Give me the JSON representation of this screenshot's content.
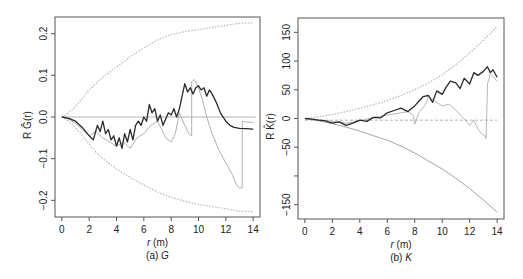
{
  "chart_data": [
    {
      "id": "a",
      "type": "line",
      "caption": "(a) G",
      "caption_prefix": "(a) ",
      "caption_symbol": "G",
      "xlabel": "r (m)",
      "xlabel_var": "r",
      "xlabel_unit": " (m)",
      "ylabel": "R Ĝ(r)",
      "xlim": [
        -0.5,
        14.5
      ],
      "ylim": [
        -0.24,
        0.24
      ],
      "xticks": [
        0,
        2,
        4,
        6,
        8,
        10,
        12,
        14
      ],
      "yticks": [
        -0.2,
        -0.1,
        0.0,
        0.1,
        0.2
      ],
      "ytick_labels": [
        "−0.2",
        "−0.1",
        "0.0",
        "0.1",
        "0.2"
      ],
      "grid": false,
      "frame": {
        "left": 55,
        "top": 17,
        "right": 260,
        "bottom": 217
      },
      "series": [
        {
          "name": "upper envelope",
          "style": "dotted",
          "color": "#b8b8b8",
          "x": [
            0,
            0.5,
            1,
            1.5,
            2,
            2.5,
            3,
            4,
            5,
            6,
            7,
            8,
            9,
            10,
            11,
            12,
            13,
            14
          ],
          "y": [
            0,
            0.01,
            0.025,
            0.045,
            0.065,
            0.08,
            0.095,
            0.12,
            0.145,
            0.165,
            0.185,
            0.198,
            0.205,
            0.21,
            0.215,
            0.22,
            0.225,
            0.226
          ]
        },
        {
          "name": "lower envelope",
          "style": "dotted",
          "color": "#b8b8b8",
          "x": [
            0,
            0.5,
            1,
            1.5,
            2,
            2.5,
            3,
            4,
            5,
            6,
            7,
            8,
            9,
            10,
            11,
            12,
            13,
            14
          ],
          "y": [
            0,
            -0.01,
            -0.025,
            -0.045,
            -0.065,
            -0.085,
            -0.1,
            -0.125,
            -0.145,
            -0.163,
            -0.18,
            -0.193,
            -0.202,
            -0.21,
            -0.215,
            -0.22,
            -0.226,
            -0.227
          ]
        },
        {
          "name": "theoretical",
          "style": "solid",
          "color": "#cccccc",
          "x": [
            0,
            14.2
          ],
          "y": [
            0,
            0
          ]
        },
        {
          "name": "comparison estimate",
          "style": "solid-thin",
          "color": "#a8a8a8",
          "x": [
            0,
            0.5,
            1,
            1.5,
            2,
            2.5,
            3,
            3.5,
            4,
            4.5,
            5,
            5.5,
            6,
            6.5,
            7,
            7.3,
            7.6,
            8,
            8.3,
            8.6,
            9,
            9.3,
            9.5,
            9.5,
            9.7,
            10,
            10.3,
            10.6,
            11,
            11.5,
            12,
            12.5,
            12.8,
            13,
            13.2,
            13.2,
            13.5,
            14
          ],
          "y": [
            0,
            -0.005,
            -0.015,
            -0.03,
            -0.045,
            -0.035,
            -0.05,
            -0.06,
            -0.07,
            -0.06,
            -0.075,
            -0.05,
            -0.04,
            -0.02,
            -0.01,
            -0.03,
            -0.05,
            -0.06,
            -0.04,
            0.01,
            -0.02,
            -0.04,
            -0.045,
            0.085,
            0.09,
            0.07,
            0.04,
            0.0,
            -0.04,
            -0.08,
            -0.11,
            -0.14,
            -0.165,
            -0.17,
            -0.17,
            -0.01,
            -0.012,
            -0.013
          ]
        },
        {
          "name": "observed estimate",
          "style": "solid",
          "color": "#2a2a2a",
          "x": [
            0,
            0.5,
            1,
            1.5,
            2,
            2.3,
            2.6,
            2.8,
            3,
            3.2,
            3.4,
            3.6,
            3.8,
            4,
            4.2,
            4.4,
            4.6,
            4.8,
            5,
            5.2,
            5.4,
            5.6,
            5.8,
            6,
            6.2,
            6.4,
            6.6,
            6.8,
            7,
            7.2,
            7.4,
            7.6,
            7.8,
            8,
            8.2,
            8.4,
            8.6,
            8.8,
            9,
            9.2,
            9.4,
            9.6,
            9.8,
            10,
            10.2,
            10.4,
            10.6,
            10.8,
            11,
            11.3,
            11.6,
            12,
            12.3,
            12.6,
            13,
            13.5,
            14
          ],
          "y": [
            0,
            -0.003,
            -0.01,
            -0.025,
            -0.045,
            -0.055,
            -0.02,
            -0.035,
            -0.01,
            -0.04,
            -0.03,
            -0.055,
            -0.045,
            -0.07,
            -0.05,
            -0.075,
            -0.04,
            -0.06,
            -0.03,
            -0.055,
            -0.02,
            -0.01,
            -0.02,
            0.0,
            -0.01,
            0.03,
            0.01,
            0.02,
            -0.01,
            0.005,
            -0.02,
            -0.005,
            0.01,
            0.005,
            0.02,
            0.0,
            0.02,
            0.05,
            0.08,
            0.06,
            0.07,
            0.055,
            0.07,
            0.075,
            0.065,
            0.07,
            0.05,
            0.065,
            0.055,
            0.035,
            0.01,
            -0.01,
            -0.02,
            -0.025,
            -0.027,
            -0.028,
            -0.029
          ]
        }
      ]
    },
    {
      "id": "b",
      "type": "line",
      "caption": "(b) K",
      "caption_prefix": "(b) ",
      "caption_symbol": "K",
      "xlabel": "r (m)",
      "xlabel_var": "r",
      "xlabel_unit": " (m)",
      "ylabel": "R K̂(r)",
      "xlim": [
        -0.5,
        14.5
      ],
      "ylim": [
        -175,
        175
      ],
      "xticks": [
        0,
        2,
        4,
        6,
        8,
        10,
        12,
        14
      ],
      "yticks": [
        -150,
        -100,
        -50,
        0,
        50,
        100,
        150
      ],
      "ytick_labels": [
        "−150",
        "",
        "−50",
        "0",
        "50",
        "100",
        "150"
      ],
      "grid": false,
      "frame": {
        "left": 298,
        "top": 18,
        "right": 504,
        "bottom": 219
      },
      "series": [
        {
          "name": "upper envelope",
          "style": "dotted",
          "color": "#b8b8b8",
          "x": [
            0,
            1,
            2,
            3,
            4,
            5,
            6,
            7,
            8,
            9,
            10,
            11,
            12,
            13,
            14
          ],
          "y": [
            0,
            3,
            7,
            12,
            18,
            24,
            31,
            40,
            50,
            62,
            76,
            94,
            114,
            136,
            160
          ]
        },
        {
          "name": "lower envelope",
          "style": "solid-thin",
          "color": "#9a9a9a",
          "x": [
            0,
            1,
            2,
            3,
            4,
            5,
            6,
            7,
            8,
            9,
            10,
            11,
            12,
            13,
            14
          ],
          "y": [
            0,
            -4,
            -9,
            -15,
            -22,
            -30,
            -38,
            -48,
            -60,
            -74,
            -88,
            -104,
            -122,
            -142,
            -163
          ]
        },
        {
          "name": "theoretical",
          "style": "dashed",
          "color": "#aaaaaa",
          "x": [
            0,
            14
          ],
          "y": [
            -3,
            -3
          ]
        },
        {
          "name": "comparison estimate",
          "style": "solid-thin",
          "color": "#b0b0b0",
          "x": [
            0,
            1,
            2,
            3,
            4,
            5,
            6,
            7,
            7.5,
            7.9,
            8,
            8.3,
            8.8,
            9,
            9.5,
            10,
            10.5,
            11,
            11.5,
            12,
            12.3,
            12.6,
            12.8,
            13.1,
            13.2,
            13.3,
            13.5,
            14
          ],
          "y": [
            0,
            -2,
            -5,
            -8,
            -4,
            2,
            6,
            10,
            12,
            5,
            -10,
            10,
            25,
            38,
            30,
            22,
            25,
            14,
            2,
            -12,
            -3,
            -18,
            -25,
            -30,
            -35,
            60,
            78,
            65
          ]
        },
        {
          "name": "observed estimate",
          "style": "solid",
          "color": "#2a2a2a",
          "x": [
            0,
            0.5,
            1,
            1.5,
            2,
            2.5,
            3,
            3.5,
            4,
            4.5,
            5,
            5.5,
            6,
            6.5,
            7,
            7.5,
            8,
            8.3,
            8.6,
            9,
            9.3,
            9.6,
            10,
            10.3,
            10.6,
            11,
            11.3,
            11.6,
            12,
            12.3,
            12.6,
            13,
            13.3,
            13.5,
            13.7,
            14
          ],
          "y": [
            0,
            -1,
            -3,
            -4,
            -8,
            -6,
            -12,
            -8,
            -3,
            -5,
            2,
            1,
            10,
            14,
            18,
            12,
            22,
            30,
            38,
            40,
            28,
            48,
            42,
            55,
            65,
            62,
            52,
            70,
            60,
            80,
            75,
            82,
            90,
            80,
            85,
            72
          ]
        }
      ]
    }
  ]
}
